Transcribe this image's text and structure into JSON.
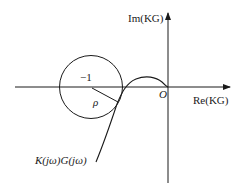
{
  "diagram": {
    "type": "nyquist-plot",
    "axes": {
      "x_label": "Re(KG)",
      "y_label": "Im(KG)",
      "origin_label": "O"
    },
    "critical_point": {
      "label": "−1"
    },
    "circle": {
      "radius_label": "ρ"
    },
    "curve": {
      "label": "K(jω)G(jω)"
    },
    "colors": {
      "stroke": "#1a1a1a",
      "background": "#ffffff"
    }
  }
}
